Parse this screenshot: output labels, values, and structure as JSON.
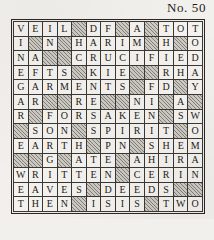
{
  "puzzle": {
    "number_label": "No. 50",
    "columns": 13,
    "rows": 13,
    "block_marker": "#",
    "colors": {
      "paper": "#f2f0ec",
      "cell_fill": "#f4f2ee",
      "block_fill": "#cdc9c3",
      "grid_line": "#3b3734",
      "ink": "#1d1a18"
    },
    "grid": [
      [
        "V",
        "E",
        "I",
        "L",
        "#",
        "D",
        "F",
        "#",
        "A",
        "#",
        "T",
        "O",
        "T"
      ],
      [
        "I",
        "#",
        "N",
        "#",
        "H",
        "A",
        "R",
        "I",
        "M",
        "#",
        "H",
        "#",
        "O"
      ],
      [
        "N",
        "A",
        "#",
        "#",
        "C",
        "R",
        "U",
        "C",
        "I",
        "F",
        "I",
        "E",
        "D"
      ],
      [
        "E",
        "F",
        "T",
        "S",
        "#",
        "K",
        "I",
        "E",
        "#",
        "#",
        "R",
        "H",
        "A"
      ],
      [
        "G",
        "A",
        "R",
        "M",
        "E",
        "N",
        "T",
        "S",
        "#",
        "F",
        "D",
        "#",
        "Y"
      ],
      [
        "A",
        "R",
        "#",
        "#",
        "R",
        "E",
        "#",
        "#",
        "N",
        "I",
        "#",
        "A",
        "#"
      ],
      [
        "R",
        "#",
        "F",
        "O",
        "R",
        "S",
        "A",
        "K",
        "E",
        "N",
        "#",
        "S",
        "W"
      ],
      [
        "#",
        "S",
        "O",
        "N",
        "#",
        "S",
        "P",
        "I",
        "R",
        "I",
        "T",
        "#",
        "O"
      ],
      [
        "E",
        "A",
        "R",
        "T",
        "H",
        "#",
        "P",
        "N",
        "#",
        "S",
        "H",
        "E",
        "M"
      ],
      [
        "#",
        "#",
        "G",
        "#",
        "A",
        "T",
        "E",
        "#",
        "A",
        "H",
        "I",
        "R",
        "A"
      ],
      [
        "W",
        "R",
        "I",
        "T",
        "T",
        "E",
        "N",
        "#",
        "C",
        "E",
        "R",
        "I",
        "N"
      ],
      [
        "E",
        "A",
        "V",
        "E",
        "S",
        "#",
        "D",
        "E",
        "E",
        "D",
        "S",
        "#",
        "#"
      ],
      [
        "T",
        "H",
        "E",
        "N",
        "#",
        "I",
        "S",
        "I",
        "S",
        "#",
        "T",
        "W",
        "O"
      ]
    ]
  }
}
